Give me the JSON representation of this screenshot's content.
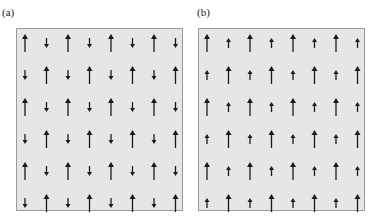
{
  "figure": {
    "panels": [
      {
        "label": "(a)",
        "description": "antiferromagnetic ordering: alternating large up and small down moments",
        "rows": 6,
        "cols": 8,
        "pattern": "checkerboard",
        "long_arrow": {
          "direction": "up",
          "length": 18
        },
        "short_arrow": {
          "direction": "down",
          "length": 10
        }
      },
      {
        "label": "(b)",
        "description": "ferrimagnetic ordering: alternating large up and small up moments",
        "rows": 6,
        "cols": 8,
        "pattern": "checkerboard",
        "long_arrow": {
          "direction": "up",
          "length": 18
        },
        "short_arrow": {
          "direction": "up",
          "length": 10
        }
      }
    ],
    "colors": {
      "panel_bg": "#e6e6e6",
      "panel_border": "#9a9a9a",
      "arrow": "#1a1a1a"
    }
  }
}
